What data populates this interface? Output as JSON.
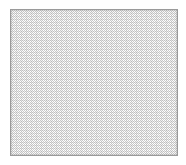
{
  "image": {
    "width_px": 186,
    "height_px": 165,
    "background_color": "#ffffff",
    "content_description": "Dithered texture swatch panel"
  },
  "panel": {
    "name": "texture-swatch",
    "x_px": 10,
    "y_px": 9,
    "width_px": 168,
    "height_px": 147,
    "border_color": "#9a9a9a",
    "border_width_px": 1,
    "fill_base_color": "#ffffff",
    "fill_dither_color": "#c9c9c9",
    "pattern": "checkerboard-dither",
    "pattern_cell_px": 2,
    "label": ""
  },
  "text": {
    "title": "",
    "caption": "",
    "note": ""
  }
}
